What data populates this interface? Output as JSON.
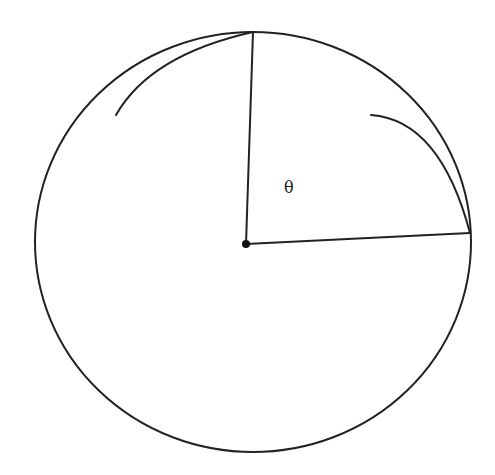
{
  "diagram": {
    "type": "geometry",
    "circle": {
      "cx": 253,
      "cy": 242,
      "rx": 218,
      "ry": 210
    },
    "center_point": {
      "x": 246,
      "y": 244
    },
    "radius_top_end": {
      "x": 253,
      "y": 32
    },
    "radius_right_end": {
      "x": 470,
      "y": 233
    },
    "angle_label": "θ",
    "angle_label_pos": {
      "x": 289,
      "y": 193
    },
    "stroke_color": "#222222",
    "background": "#ffffff"
  }
}
